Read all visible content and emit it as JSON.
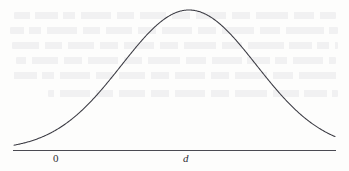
{
  "figure": {
    "type": "normal-distribution-bell-curve",
    "caption": "",
    "background_color": "#fdfdfc",
    "curve_color": "#3a3a42",
    "axis_color": "#4a4a52",
    "label_color": "#2e2e34"
  },
  "axis": {
    "name": "horizontal-axis",
    "y_pixel": 150,
    "x_start_pixel": 13,
    "x_end_pixel": 336,
    "labels": [
      {
        "text": "0",
        "italic": false,
        "x_pixel": 57,
        "y_pixel": 154
      },
      {
        "text": "d",
        "italic": true,
        "x_pixel": 186,
        "y_pixel": 154
      }
    ]
  },
  "chart_data": {
    "type": "line",
    "title": "",
    "subtitle": "",
    "xlabel": "",
    "ylabel": "",
    "grid": false,
    "legend": "none",
    "annotations": [
      {
        "label": "0",
        "x": 0,
        "note": "origin tick on horizontal axis"
      },
      {
        "label": "d",
        "x": 3.1,
        "note": "mean / peak location tick on horizontal axis"
      }
    ],
    "distribution": {
      "family": "normal",
      "mean_label": "d",
      "mean_x": 3.1,
      "sigma": 1.62,
      "peak_pixel": {
        "x": 189,
        "y": 10
      }
    },
    "xlim": [
      -1.3,
      8.0
    ],
    "ylim": [
      0,
      1.05
    ],
    "x": [
      -1.3,
      -1.0,
      -0.7,
      -0.4,
      -0.1,
      0.2,
      0.5,
      0.8,
      1.1,
      1.4,
      1.7,
      2.0,
      2.3,
      2.6,
      2.9,
      3.1,
      3.4,
      3.7,
      4.0,
      4.3,
      4.6,
      4.9,
      5.2,
      5.5,
      5.8,
      6.1,
      6.4,
      6.7,
      7.0,
      7.3,
      7.6,
      8.0
    ],
    "y": [
      0.007,
      0.013,
      0.023,
      0.037,
      0.058,
      0.086,
      0.123,
      0.168,
      0.222,
      0.285,
      0.354,
      0.449,
      0.548,
      0.682,
      0.801,
      0.996,
      0.947,
      0.879,
      0.801,
      0.682,
      0.548,
      0.449,
      0.354,
      0.285,
      0.222,
      0.168,
      0.123,
      0.086,
      0.058,
      0.037,
      0.023,
      0.007
    ],
    "categories": [],
    "values": []
  }
}
